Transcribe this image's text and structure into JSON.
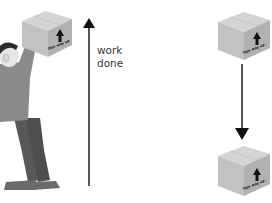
{
  "diagram": {
    "left_scene": {
      "description": "person lifting box overhead",
      "box": {
        "label": "This way up",
        "icon": "arrow-up-icon"
      },
      "arrow": {
        "direction": "up",
        "icon": "long-arrow-up-icon"
      },
      "label_line1": "work",
      "label_line2": "done"
    },
    "right_scene": {
      "description": "box falling",
      "top_box": {
        "label": "This way up",
        "icon": "arrow-up-icon"
      },
      "arrow": {
        "direction": "down",
        "icon": "long-arrow-down-icon"
      },
      "bottom_box": {
        "label": "This way up",
        "icon": "arrow-up-icon"
      }
    },
    "colors": {
      "box_top": "#d4d4d4",
      "box_left": "#c2c2c2",
      "box_right": "#b1b1b1",
      "arrow": "#111111",
      "shirt": "#8a8a8a",
      "trousers": "#585858",
      "skin": "#e6e6e6",
      "hair": "#2a2a2a",
      "shoes": "#6a6a6a"
    }
  }
}
